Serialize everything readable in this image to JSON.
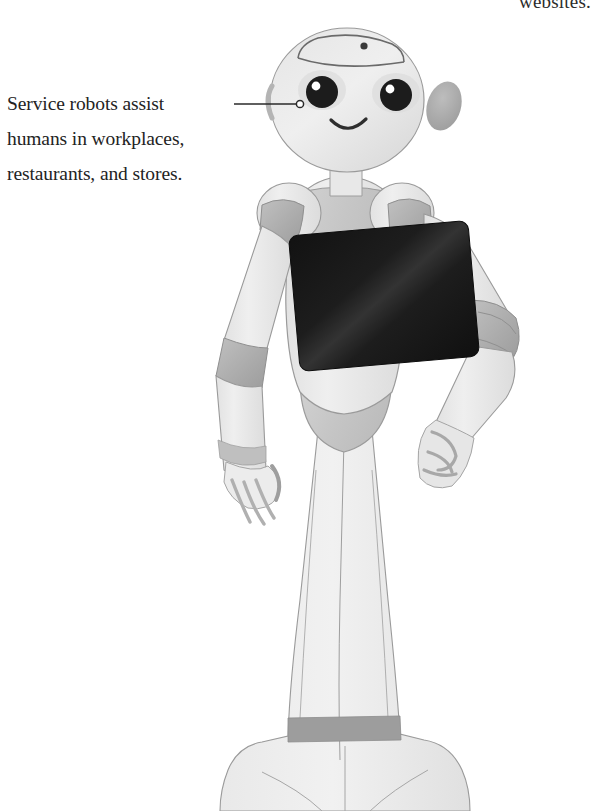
{
  "page": {
    "width": 599,
    "height": 811,
    "background_color": "#ffffff",
    "kind": "textbook-figure"
  },
  "body_text": {
    "partial_line_top": "websites."
  },
  "annotation": {
    "caption_lines": [
      "Service robots assist",
      "humans in workplaces,",
      "restaurants, and stores."
    ],
    "caption_full": "Service robots assist humans in workplaces, restaurants, and stores.",
    "leader_line": {
      "start_x": 234,
      "start_y": 104,
      "end_x": 296,
      "end_y": 104,
      "endpoint_marker": "open-circle",
      "endpoint_x": 300,
      "endpoint_y": 104,
      "color": "#2a2a2a"
    }
  },
  "figure": {
    "colors": {
      "body_light": "#ececec",
      "body_mid": "#dcdcdc",
      "joint_gray": "#b0b0b0",
      "joint_gray_dark": "#a0a0a0",
      "torso_gray": "#c8c8c8",
      "outline": "#8d8d8d",
      "screen_dark": "#1a1a1a",
      "eye_dark": "#1c1c1c",
      "text_dark": "#232323"
    },
    "parts": [
      {
        "name": "head",
        "note": "rounded dome with visor seam line"
      },
      {
        "name": "forehead-sensor-dot",
        "note": "small dark dot"
      },
      {
        "name": "left-eye",
        "note": "large dark circle with white highlight"
      },
      {
        "name": "right-eye",
        "note": "large dark circle with white highlight"
      },
      {
        "name": "mouth",
        "note": "thin curved smile"
      },
      {
        "name": "ear-patch",
        "note": "gray tilted oval on right side of head"
      },
      {
        "name": "neck",
        "note": "light vertical post"
      },
      {
        "name": "collar",
        "note": "darker gray chest collar"
      },
      {
        "name": "left-shoulder-pad",
        "note": "rounded light pad"
      },
      {
        "name": "right-shoulder-pad",
        "note": "rounded light pad"
      },
      {
        "name": "left-arm",
        "note": "hangs down, hand open with fingers curled"
      },
      {
        "name": "right-arm",
        "note": "bent, hand resting on hip"
      },
      {
        "name": "chest-tablet",
        "note": "dark rotated rectangle with diagonal sheen"
      },
      {
        "name": "hip-section",
        "note": "darker gray rounded pelvis"
      },
      {
        "name": "lower-body",
        "note": "tapering column with vertical seam lines"
      },
      {
        "name": "base-band",
        "note": "dark horizontal ring near base"
      },
      {
        "name": "wheeled-base",
        "note": "wide rounded base"
      }
    ]
  }
}
